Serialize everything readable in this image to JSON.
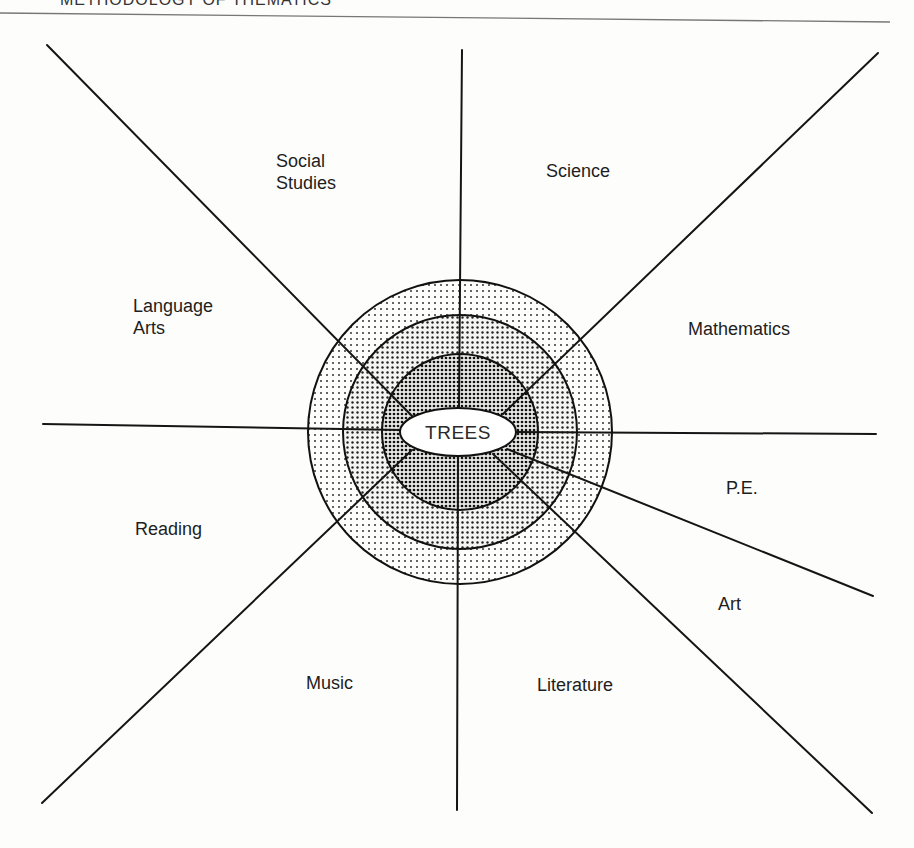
{
  "header": {
    "running_title": "METHODOLOGY OF THEMATICS"
  },
  "diagram": {
    "center": "TREES",
    "subjects": [
      {
        "id": "social-studies",
        "label": "Social\nStudies",
        "x": 276,
        "y": 150
      },
      {
        "id": "science",
        "label": "Science",
        "x": 546,
        "y": 160
      },
      {
        "id": "language-arts",
        "label": "Language\nArts",
        "x": 133,
        "y": 295
      },
      {
        "id": "mathematics",
        "label": "Mathematics",
        "x": 688,
        "y": 318
      },
      {
        "id": "pe",
        "label": "P.E.",
        "x": 726,
        "y": 479
      },
      {
        "id": "reading",
        "label": "Reading",
        "x": 135,
        "y": 519
      },
      {
        "id": "art",
        "label": "Art",
        "x": 718,
        "y": 594
      },
      {
        "id": "music",
        "label": "Music",
        "x": 306,
        "y": 673
      },
      {
        "id": "literature",
        "label": "Literature",
        "x": 537,
        "y": 675
      }
    ],
    "rings": [
      "outer",
      "middle",
      "inner"
    ]
  }
}
